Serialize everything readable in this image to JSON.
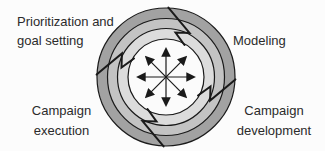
{
  "diagram": {
    "title_implicit": "Campaign management cycle",
    "labels": {
      "top_left": "Prioritization and\ngoal setting",
      "top_right": "Modeling",
      "bottom_left": "Campaign\nexecution",
      "bottom_right": "Campaign\ndevelopment"
    },
    "icons": {
      "hub": "eight-direction-radial-arrows-icon",
      "wheel": "four-blade-ring-wheel-icon"
    },
    "arrow_directions": 8,
    "blade_count": 4,
    "colors": {
      "outer_ring": "#a2a2a2",
      "middle_ring": "#c3c3c3",
      "inner_ring": "#dcdcdc",
      "hub": "#fbfbfb",
      "line": "#1a1a1a",
      "text": "#2b2b2b",
      "background": "#fcfcfc"
    }
  }
}
